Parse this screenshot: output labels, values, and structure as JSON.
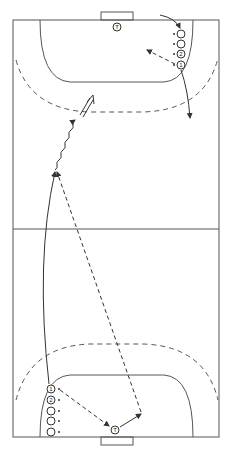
{
  "diagram": {
    "type": "handball-drill",
    "court": {
      "x1": 13,
      "y1": 20,
      "x2": 219,
      "y2": 437,
      "midline_y": 229
    },
    "colors": {
      "line": "#555555",
      "ink": "#333333",
      "background": "#ffffff"
    },
    "top": {
      "goalkeeper_label": "T",
      "players": [
        {
          "label": "",
          "x": 181,
          "y": 34
        },
        {
          "label": "",
          "x": 181,
          "y": 44
        },
        {
          "label": "2",
          "x": 181,
          "y": 54
        },
        {
          "label": "1",
          "x": 181,
          "y": 65
        }
      ]
    },
    "bottom": {
      "goalkeeper_label": "T",
      "players": [
        {
          "label": "1",
          "x": 51,
          "y": 389
        },
        {
          "label": "2",
          "x": 51,
          "y": 400
        },
        {
          "label": "",
          "x": 51,
          "y": 411
        },
        {
          "label": "",
          "x": 51,
          "y": 421
        },
        {
          "label": "",
          "x": 51,
          "y": 432
        }
      ]
    },
    "legend": {
      "solid_arrow": "player run",
      "dashed_arrow": "pass",
      "wavy_arrow": "dribble",
      "double_arrow": "shot"
    }
  }
}
